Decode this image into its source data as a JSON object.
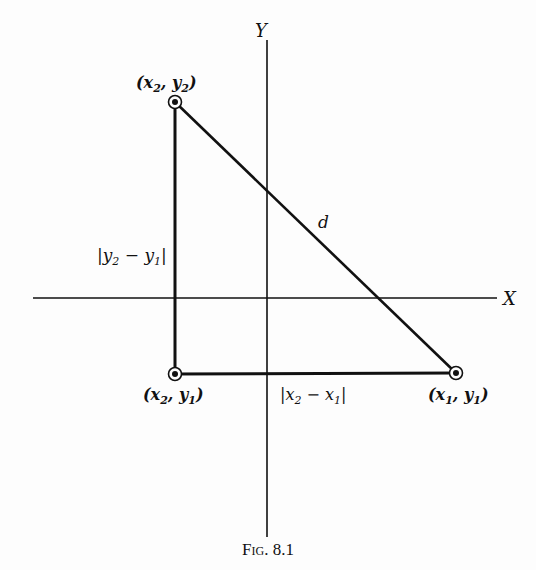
{
  "figure": {
    "caption": "Fig. 8.1",
    "axes": {
      "x_label": "X",
      "y_label": "Y"
    },
    "points": [
      {
        "id": "p2",
        "var_x": "x",
        "sub_x": "2",
        "var_y": "y",
        "sub_y": "2"
      },
      {
        "id": "p3",
        "var_x": "x",
        "sub_x": "2",
        "var_y": "y",
        "sub_y": "1"
      },
      {
        "id": "p1",
        "var_x": "x",
        "sub_x": "1",
        "var_y": "y",
        "sub_y": "1"
      }
    ],
    "segments": {
      "hypotenuse_label": "d",
      "vertical_leg": {
        "a": "y",
        "a_sub": "2",
        "b": "y",
        "b_sub": "1"
      },
      "horizontal_leg": {
        "a": "x",
        "a_sub": "2",
        "b": "x",
        "b_sub": "1"
      }
    },
    "colors": {
      "ink": "#111111",
      "paper": "#fdfdfd"
    }
  }
}
